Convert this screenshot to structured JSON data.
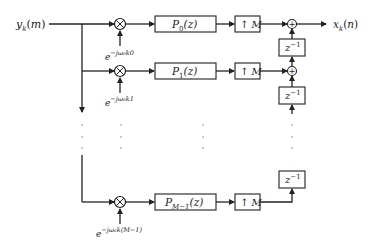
{
  "diagram": {
    "type": "block-diagram",
    "title": "",
    "input_label": "y_k(m)",
    "output_label": "x_k(n)",
    "branches": [
      {
        "index": 0,
        "exponent_label": "e^{-jω_0 k0}",
        "exp_base": "e",
        "exp_sup": "−jω₀k0",
        "filter_label": "P_0(z)",
        "filter_main": "P",
        "filter_sub": "0",
        "filter_arg": "(z)",
        "upsampler_label": "↑ M",
        "delay_label": "z^{-1}"
      },
      {
        "index": 1,
        "exponent_label": "e^{-jω_0 k1}",
        "exp_base": "e",
        "exp_sup": "−jω₀k1",
        "filter_label": "P_1(z)",
        "filter_main": "P",
        "filter_sub": "1",
        "filter_arg": "(z)",
        "upsampler_label": "↑ M",
        "delay_label": "z^{-1}"
      },
      {
        "index": "M-1",
        "exponent_label": "e^{-jω_0 k(M-1)}",
        "exp_base": "e",
        "exp_sup": "−jω₀k(M−1)",
        "filter_label": "P_{M-1}(z)",
        "filter_main": "P",
        "filter_sub": "M−1",
        "filter_arg": "(z)",
        "upsampler_label": "↑ M",
        "delay_label": "z^{-1}"
      }
    ],
    "delay_main": "z",
    "delay_sup": "−1",
    "ellipsis": "⋮",
    "multiplier_symbol": "⊗",
    "adder_symbol": "+"
  }
}
